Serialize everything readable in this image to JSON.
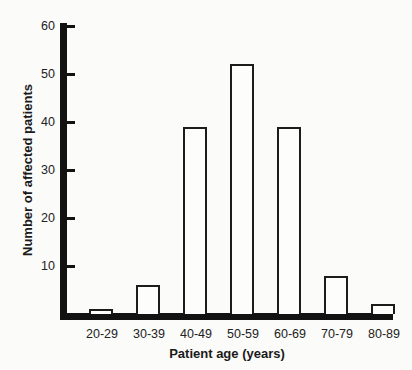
{
  "chart_data": {
    "type": "bar",
    "title": "",
    "categories": [
      "20-29",
      "30-39",
      "40-49",
      "50-59",
      "60-69",
      "70-79",
      "80-89"
    ],
    "values": [
      1,
      6,
      39,
      52,
      39,
      8,
      2
    ],
    "xlabel": "Patient age (years)",
    "ylabel": "Number of affected patients",
    "ylim": [
      0,
      60
    ],
    "yticks": [
      10,
      20,
      30,
      40,
      50,
      60
    ],
    "grid": false,
    "legend": "none",
    "bar_fill_color": "#fdfdfc",
    "bar_border_color": "#1c1c1c",
    "axis_color": "#121212",
    "background_color": "#fbfbf9"
  }
}
